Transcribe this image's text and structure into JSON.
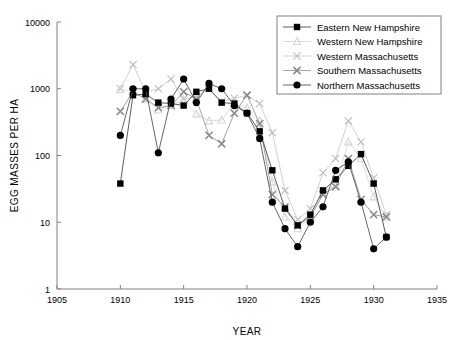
{
  "chart_data": {
    "type": "line",
    "title": "",
    "xlabel": "YEAR",
    "ylabel": "EGG MASSES PER HA",
    "xlim": [
      1905,
      1935
    ],
    "ylim": [
      1,
      10000
    ],
    "yscale": "log",
    "grid": false,
    "legend_position": "top-right",
    "xticks": [
      1905,
      1910,
      1915,
      1920,
      1925,
      1930,
      1935
    ],
    "xtick_labels": [
      "1905",
      "1910",
      "1915",
      "1920",
      "1925",
      "1930",
      "1935"
    ],
    "yticks": [
      1,
      10,
      100,
      1000,
      10000
    ],
    "ytick_labels": [
      "1",
      "10",
      "100",
      "1000",
      "10000"
    ],
    "series": [
      {
        "name": "Eastern New Hampshire",
        "marker": "filled-square",
        "color": "#000000",
        "line_color": "#4a4a4a",
        "x": [
          1910,
          1911,
          1912,
          1913,
          1914,
          1915,
          1916,
          1917,
          1918,
          1919,
          1920,
          1921,
          1922,
          1923,
          1924,
          1925,
          1926,
          1927,
          1928,
          1929,
          1930,
          1931
        ],
        "y": [
          38,
          800,
          830,
          620,
          600,
          560,
          900,
          1000,
          620,
          600,
          430,
          230,
          60,
          16,
          9,
          13,
          30,
          44,
          70,
          105,
          38,
          6
        ]
      },
      {
        "name": "Western New Hampshire",
        "marker": "light-triangle",
        "color": "#d6d6d6",
        "line_color": "#d9d9d9",
        "x": [
          1910,
          1911,
          1912,
          1913,
          1914,
          1915,
          1916,
          1917,
          1918,
          1919,
          1920,
          1921,
          1922,
          1923,
          1924,
          1925,
          1926,
          1927,
          1928,
          1929,
          1930,
          1931
        ],
        "y": [
          980,
          900,
          700,
          480,
          560,
          680,
          420,
          330,
          340,
          600,
          520,
          330,
          40,
          12,
          8,
          12,
          28,
          36,
          160,
          90,
          24,
          12
        ]
      },
      {
        "name": "Western Massachusetts",
        "marker": "light-x",
        "color": "#bdbdbd",
        "line_color": "#cccccc",
        "x": [
          1910,
          1911,
          1912,
          1913,
          1914,
          1915,
          1916,
          1917,
          1918,
          1919,
          1920,
          1921,
          1922,
          1923,
          1924,
          1925,
          1926,
          1927,
          1928,
          1929,
          1930,
          1931
        ],
        "y": [
          1000,
          2300,
          900,
          1000,
          1400,
          700,
          760,
          1000,
          640,
          720,
          800,
          600,
          220,
          30,
          11,
          16,
          55,
          90,
          330,
          160,
          46,
          13
        ]
      },
      {
        "name": "Southern Massachusetts",
        "marker": "gray-x",
        "color": "#8a8a8a",
        "line_color": "#9a9a9a",
        "x": [
          1910,
          1911,
          1912,
          1913,
          1914,
          1915,
          1916,
          1917,
          1918,
          1919,
          1920,
          1921,
          1922,
          1923,
          1924,
          1925,
          1926,
          1927,
          1928,
          1929,
          1930,
          1931
        ],
        "y": [
          460,
          900,
          700,
          520,
          560,
          900,
          700,
          200,
          150,
          430,
          800,
          300,
          26,
          17,
          9,
          12,
          26,
          34,
          90,
          22,
          13,
          12
        ]
      },
      {
        "name": "Northern Massachusetts",
        "marker": "filled-circle",
        "color": "#000000",
        "line_color": "#555555",
        "x": [
          1910,
          1911,
          1912,
          1913,
          1914,
          1915,
          1916,
          1917,
          1918,
          1919,
          1920,
          1921,
          1922,
          1923,
          1924,
          1925,
          1926,
          1927,
          1928,
          1929,
          1930,
          1931
        ],
        "y": [
          200,
          1000,
          1000,
          110,
          700,
          1400,
          620,
          1200,
          1000,
          560,
          430,
          180,
          20,
          8,
          4.3,
          10,
          17,
          60,
          80,
          20,
          4,
          6
        ]
      }
    ]
  }
}
